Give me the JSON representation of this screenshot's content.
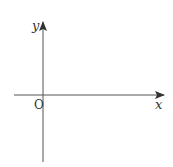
{
  "diagram": {
    "type": "cartesian-axes",
    "x_axis_label": "x",
    "y_axis_label": "y",
    "origin_label": "O",
    "colors": {
      "axis": "#555555",
      "text": "#333333",
      "background": "#ffffff"
    }
  }
}
